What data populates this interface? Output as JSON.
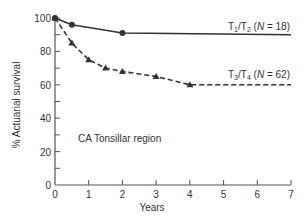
{
  "chart_data": {
    "type": "line",
    "title": "",
    "xlabel": "Years",
    "ylabel": "% Actuarial survival",
    "xlim": [
      0,
      7
    ],
    "ylim": [
      0,
      100
    ],
    "x_ticks": [
      0,
      1,
      2,
      3,
      4,
      5,
      6,
      7
    ],
    "y_ticks": [
      0,
      20,
      40,
      60,
      80,
      100
    ],
    "y_minor_ticks": [
      10,
      30,
      50,
      70,
      90
    ],
    "grid": false,
    "legend": "inline labels at right",
    "annotations": [
      {
        "text": "CA Tonsillar region",
        "x": 0.5,
        "y": 38
      }
    ],
    "series": [
      {
        "name": "T1/T2 (N = 18)",
        "label_main": "T",
        "label_parts": [
          "T",
          "1",
          "/T",
          "2",
          " (",
          "N",
          " = 18)"
        ],
        "style": "solid",
        "marker": "circle",
        "color": "#333333",
        "x": [
          0,
          0.5,
          2,
          7
        ],
        "y": [
          100,
          96,
          91,
          90
        ],
        "markers_at": [
          0,
          0.5,
          2
        ]
      },
      {
        "name": "T3/T4 (N = 62)",
        "label_parts": [
          "T",
          "3",
          "/T",
          "4",
          " (",
          "N",
          " = 62)"
        ],
        "style": "dashed",
        "marker": "triangle",
        "color": "#333333",
        "x": [
          0,
          0.5,
          1,
          1.5,
          2,
          3,
          4,
          7
        ],
        "y": [
          100,
          85,
          75,
          70,
          68,
          65,
          60,
          60
        ],
        "markers_at": [
          0,
          0.5,
          1,
          1.5,
          2,
          3,
          4
        ]
      }
    ]
  }
}
